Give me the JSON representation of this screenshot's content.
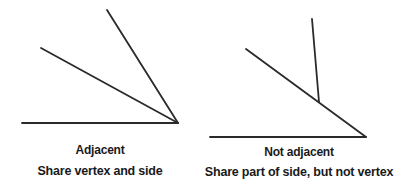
{
  "colors": {
    "line": "#2a2a2a",
    "text": "#1a1a1a",
    "background": "#ffffff"
  },
  "panels": [
    {
      "title": "Adjacent",
      "caption": "Share vertex and side"
    },
    {
      "title": "Not adjacent",
      "caption": "Share part of side, but not vertex"
    }
  ]
}
